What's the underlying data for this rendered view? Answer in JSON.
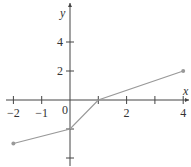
{
  "chart_data": {
    "type": "line",
    "title": "",
    "xlabel": "x",
    "ylabel": "y",
    "xlim": [
      -2,
      4
    ],
    "ylim": [
      -4.5,
      6
    ],
    "grid": false,
    "x_ticks": [
      -2,
      -1,
      0,
      1,
      2,
      3,
      4
    ],
    "x_tick_labels": [
      {
        "value": -2,
        "label": "−2"
      },
      {
        "value": -1,
        "label": "−1"
      },
      {
        "value": 2,
        "label": "2"
      },
      {
        "value": 4,
        "label": "4"
      }
    ],
    "origin_label": "0",
    "y_ticks": [
      -4,
      -2,
      2,
      4
    ],
    "y_tick_labels": [
      {
        "value": 2,
        "label": "2"
      },
      {
        "value": 4,
        "label": "4"
      }
    ],
    "series": [
      {
        "name": "piecewise",
        "x": [
          -2,
          0,
          1,
          4
        ],
        "y": [
          -3,
          -2,
          0,
          2
        ],
        "endpoints": [
          [
            -2,
            -3
          ],
          [
            4,
            2
          ]
        ],
        "color": "#999999"
      }
    ]
  }
}
